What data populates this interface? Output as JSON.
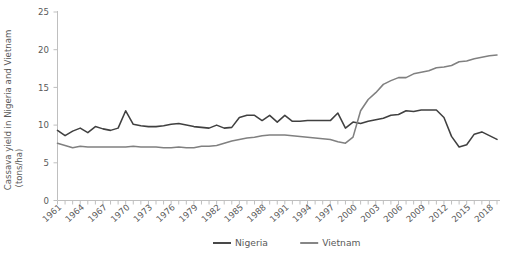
{
  "chart_data": {
    "type": "line",
    "title": "",
    "xlabel": "",
    "ylabel": "Cassava yield in Nigeria and Vietnam (tons/ha)",
    "ylabel_line1": "Cassava yield in Nigeria and Vietnam",
    "ylabel_line2": "(tons/ha)",
    "ylim": [
      0,
      25
    ],
    "yticks": [
      0,
      5,
      10,
      15,
      20,
      25
    ],
    "ytick_labels": [
      "0",
      "5",
      "10",
      "15",
      "20",
      "25"
    ],
    "xlim": [
      1961,
      2019
    ],
    "grid": false,
    "legend_position": "bottom",
    "x": [
      1961,
      1962,
      1963,
      1964,
      1965,
      1966,
      1967,
      1968,
      1969,
      1970,
      1971,
      1972,
      1973,
      1974,
      1975,
      1976,
      1977,
      1978,
      1979,
      1980,
      1981,
      1982,
      1983,
      1984,
      1985,
      1986,
      1987,
      1988,
      1989,
      1990,
      1991,
      1992,
      1993,
      1994,
      1995,
      1996,
      1997,
      1998,
      1999,
      2000,
      2001,
      2002,
      2003,
      2004,
      2005,
      2006,
      2007,
      2008,
      2009,
      2010,
      2011,
      2012,
      2013,
      2014,
      2015,
      2016,
      2017,
      2018,
      2019
    ],
    "xtick_labels": [
      "1961",
      "1964",
      "1967",
      "1970",
      "1973",
      "1976",
      "1979",
      "1982",
      "1985",
      "1988",
      "1991",
      "1994",
      "1997",
      "2000",
      "2003",
      "2006",
      "2009",
      "2012",
      "2015",
      "2018"
    ],
    "xticks": [
      1961,
      1964,
      1967,
      1970,
      1973,
      1976,
      1979,
      1982,
      1985,
      1988,
      1991,
      1994,
      1997,
      2000,
      2003,
      2006,
      2009,
      2012,
      2015,
      2018
    ],
    "series": [
      {
        "name": "Nigeria",
        "color": "#404040",
        "values": [
          9.3,
          8.6,
          9.2,
          9.6,
          9.0,
          9.8,
          9.5,
          9.3,
          9.6,
          11.9,
          10.1,
          9.9,
          9.8,
          9.8,
          9.9,
          10.1,
          10.2,
          10.0,
          9.8,
          9.7,
          9.6,
          10.0,
          9.6,
          9.7,
          11.0,
          11.3,
          11.3,
          10.6,
          11.3,
          10.4,
          11.3,
          10.5,
          10.5,
          10.6,
          10.6,
          10.6,
          10.6,
          11.6,
          9.6,
          10.4,
          10.2,
          10.5,
          10.7,
          10.9,
          11.3,
          11.4,
          11.9,
          11.8,
          12.0,
          12.0,
          12.0,
          11.0,
          8.5,
          7.1,
          7.4,
          8.8,
          9.1,
          8.6,
          8.1
        ]
      },
      {
        "name": "Vietnam",
        "color": "#808080",
        "values": [
          7.6,
          7.3,
          7.0,
          7.2,
          7.1,
          7.1,
          7.1,
          7.1,
          7.1,
          7.1,
          7.2,
          7.1,
          7.1,
          7.1,
          7.0,
          7.0,
          7.1,
          7.0,
          7.0,
          7.2,
          7.2,
          7.3,
          7.6,
          7.9,
          8.1,
          8.3,
          8.4,
          8.6,
          8.7,
          8.7,
          8.7,
          8.6,
          8.5,
          8.4,
          8.3,
          8.2,
          8.1,
          7.8,
          7.6,
          8.4,
          11.9,
          13.4,
          14.3,
          15.4,
          15.9,
          16.3,
          16.3,
          16.8,
          17.0,
          17.2,
          17.6,
          17.7,
          17.9,
          18.4,
          18.5,
          18.8,
          19.0,
          19.2,
          19.3
        ]
      }
    ]
  },
  "legend": {
    "items": [
      {
        "label": "Nigeria",
        "color": "#404040"
      },
      {
        "label": "Vietnam",
        "color": "#808080"
      }
    ]
  }
}
